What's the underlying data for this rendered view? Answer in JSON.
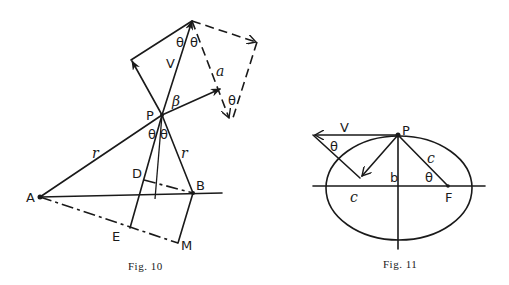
{
  "figures": [
    {
      "id": "fig10",
      "caption": "Fig. 10",
      "labels": {
        "A": "A",
        "B": "B",
        "P": "P",
        "D": "D",
        "E": "E",
        "M": "M",
        "V": "V",
        "a": "a",
        "beta": "β",
        "r1": "r",
        "r2": "r",
        "theta_top_left": "θ",
        "theta_top_right": "θ",
        "theta_P_left": "θ",
        "theta_P_right": "θ",
        "theta_dashed": "θ"
      }
    },
    {
      "id": "fig11",
      "caption": "Fig. 11",
      "labels": {
        "P": "P",
        "V": "V",
        "F": "F",
        "b": "b",
        "c_focal": "c",
        "c_axis": "c",
        "theta_left": "θ",
        "theta_right": "θ"
      }
    }
  ]
}
